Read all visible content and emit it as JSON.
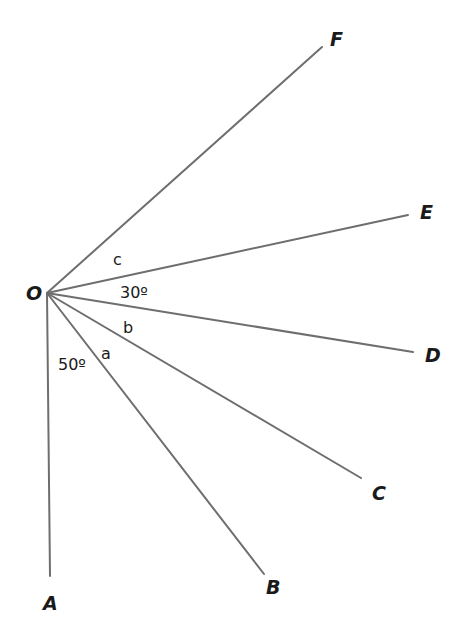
{
  "diagram": {
    "origin": {
      "label": "O",
      "x": 47,
      "y": 293,
      "label_x": 26,
      "label_y": 300
    },
    "rays": [
      {
        "id": "A",
        "label": "A",
        "end_x": 50,
        "end_y": 576,
        "label_x": 43,
        "label_y": 610
      },
      {
        "id": "B",
        "label": "B",
        "end_x": 264,
        "end_y": 574,
        "label_x": 266,
        "label_y": 594
      },
      {
        "id": "C",
        "label": "C",
        "end_x": 361,
        "end_y": 478,
        "label_x": 372,
        "label_y": 500
      },
      {
        "id": "D",
        "label": "D",
        "end_x": 413,
        "end_y": 352,
        "label_x": 425,
        "label_y": 362
      },
      {
        "id": "E",
        "label": "E",
        "end_x": 408,
        "end_y": 215,
        "label_x": 420,
        "label_y": 219
      },
      {
        "id": "F",
        "label": "F",
        "end_x": 322,
        "end_y": 47,
        "label_x": 330,
        "label_y": 46
      }
    ],
    "angle_labels": [
      {
        "id": "angle-c",
        "text": "c",
        "between": [
          "E",
          "F"
        ],
        "x": 113,
        "y": 265
      },
      {
        "id": "angle-30",
        "text": "30º",
        "between": [
          "D",
          "E"
        ],
        "x": 120,
        "y": 298
      },
      {
        "id": "angle-b",
        "text": "b",
        "between": [
          "C",
          "D"
        ],
        "x": 123,
        "y": 333
      },
      {
        "id": "angle-a",
        "text": "a",
        "between": [
          "B",
          "C"
        ],
        "x": 101,
        "y": 359
      },
      {
        "id": "angle-50",
        "text": "50º",
        "between": [
          "A",
          "B"
        ],
        "x": 58,
        "y": 370
      }
    ],
    "colors": {
      "ray": "#6e6e6e",
      "text": "#1a1a1a",
      "background": "#ffffff"
    }
  }
}
